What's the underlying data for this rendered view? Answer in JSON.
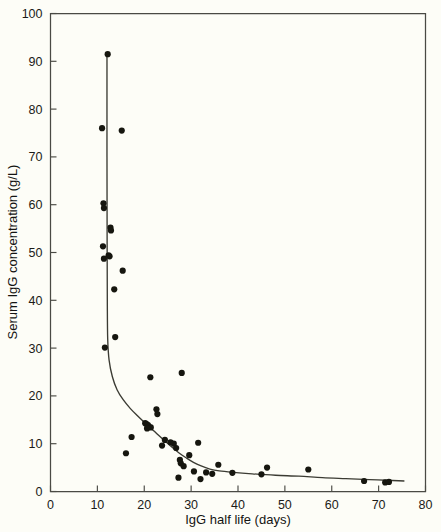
{
  "chart_data": {
    "type": "scatter",
    "title": "",
    "xlabel": "IgG half life (days)",
    "ylabel": "Serum IgG concentration (g/L)",
    "xlim": [
      0,
      80
    ],
    "ylim": [
      0,
      100
    ],
    "xticks": [
      0,
      10,
      20,
      30,
      40,
      50,
      60,
      70,
      80
    ],
    "xtick_labels": [
      "0",
      "10",
      "20",
      "30",
      "40",
      "50",
      "60",
      "70",
      "80"
    ],
    "yticks": [
      0,
      10,
      20,
      30,
      40,
      50,
      60,
      70,
      80,
      90,
      100
    ],
    "ytick_labels": [
      "0",
      "10",
      "20",
      "30",
      "40",
      "50",
      "60",
      "70",
      "80",
      "90",
      "100"
    ],
    "grid": false,
    "legend": null,
    "marker": "filled-circle",
    "marker_color": "#16160f",
    "curve_color": "#3b3b33",
    "background_color": "#fdfdf7",
    "points": [
      [
        12.2,
        91.5
      ],
      [
        11.0,
        76.0
      ],
      [
        15.2,
        75.5
      ],
      [
        11.3,
        60.3
      ],
      [
        11.4,
        59.3
      ],
      [
        12.8,
        55.2
      ],
      [
        12.9,
        54.6
      ],
      [
        11.2,
        51.3
      ],
      [
        12.4,
        49.4
      ],
      [
        12.6,
        49.2
      ],
      [
        11.4,
        48.7
      ],
      [
        15.4,
        46.2
      ],
      [
        13.6,
        42.3
      ],
      [
        13.8,
        32.3
      ],
      [
        11.6,
        30.1
      ],
      [
        28.0,
        24.8
      ],
      [
        21.3,
        23.9
      ],
      [
        22.6,
        17.2
      ],
      [
        22.8,
        16.2
      ],
      [
        20.2,
        14.3
      ],
      [
        20.5,
        14.1
      ],
      [
        20.8,
        13.9
      ],
      [
        21.0,
        13.6
      ],
      [
        21.4,
        13.4
      ],
      [
        20.6,
        13.2
      ],
      [
        31.5,
        10.2
      ],
      [
        17.3,
        11.4
      ],
      [
        24.4,
        10.8
      ],
      [
        25.6,
        10.3
      ],
      [
        26.3,
        10.0
      ],
      [
        23.8,
        9.6
      ],
      [
        26.8,
        9.1
      ],
      [
        16.1,
        8.0
      ],
      [
        29.6,
        7.6
      ],
      [
        27.6,
        6.6
      ],
      [
        27.8,
        5.9
      ],
      [
        28.4,
        5.3
      ],
      [
        30.6,
        4.2
      ],
      [
        33.2,
        4.0
      ],
      [
        34.5,
        3.7
      ],
      [
        27.3,
        2.9
      ],
      [
        32.0,
        2.6
      ],
      [
        35.8,
        5.6
      ],
      [
        38.8,
        3.9
      ],
      [
        45.0,
        3.6
      ],
      [
        46.2,
        5.0
      ],
      [
        55.0,
        4.6
      ],
      [
        66.9,
        2.2
      ],
      [
        71.4,
        1.9
      ],
      [
        72.2,
        2.0
      ]
    ],
    "fit_curve_description": "Steep near-vertical decay from ~92 g/L at 12 days falling to ~30 g/L at 12.3 days, then hyperbolic decline through ~14 at 21 days, ~5 at 32 days, flattening to ~2 g/L beyond 65 days",
    "fit_curve": [
      [
        12.05,
        91.6
      ],
      [
        12.05,
        70.0
      ],
      [
        12.08,
        52.0
      ],
      [
        12.12,
        40.0
      ],
      [
        12.2,
        32.0
      ],
      [
        12.5,
        27.5
      ],
      [
        13.2,
        24.0
      ],
      [
        14.2,
        21.3
      ],
      [
        15.5,
        19.2
      ],
      [
        17.0,
        17.4
      ],
      [
        18.5,
        15.9
      ],
      [
        20.0,
        14.5
      ],
      [
        21.5,
        13.2
      ],
      [
        23.0,
        11.8
      ],
      [
        24.5,
        10.5
      ],
      [
        26.0,
        9.2
      ],
      [
        27.5,
        8.0
      ],
      [
        29.0,
        7.0
      ],
      [
        30.5,
        6.1
      ],
      [
        32.0,
        5.4
      ],
      [
        34.0,
        4.7
      ],
      [
        36.0,
        4.3
      ],
      [
        39.0,
        4.0
      ],
      [
        43.0,
        3.7
      ],
      [
        48.0,
        3.4
      ],
      [
        53.0,
        3.2
      ],
      [
        58.0,
        2.9
      ],
      [
        63.0,
        2.7
      ],
      [
        68.0,
        2.5
      ],
      [
        73.0,
        2.3
      ],
      [
        75.5,
        2.2
      ]
    ]
  }
}
